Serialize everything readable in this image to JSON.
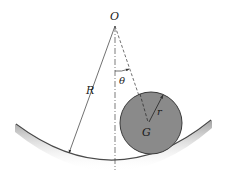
{
  "diagram": {
    "labels": {
      "center_point": "O",
      "bowl_radius": "R",
      "angle": "θ",
      "disk_radius": "r",
      "mass_center": "G"
    },
    "colors": {
      "disk_fill": "#8a8a8a",
      "disk_stroke": "#3a3a3a",
      "line": "#333333",
      "bowl_shadow": "#9a9a9a",
      "background": "#ffffff"
    }
  }
}
